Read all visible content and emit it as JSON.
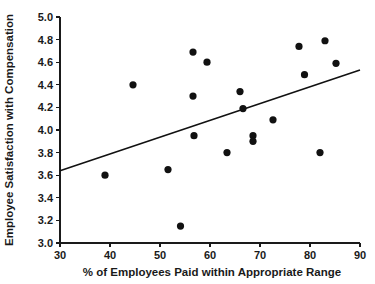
{
  "chart_data": {
    "type": "scatter",
    "title": "",
    "xlabel": "% of Employees Paid within Appropriate Range",
    "ylabel": "Employee Satisfaction with Compensation",
    "xlim": [
      30,
      90
    ],
    "ylim": [
      3.0,
      5.0
    ],
    "xticks": [
      30,
      40,
      50,
      60,
      70,
      80,
      90
    ],
    "xtick_labels": [
      "30",
      "40",
      "50",
      "60",
      "70",
      "80",
      "90"
    ],
    "yticks": [
      3.0,
      3.2,
      3.4,
      3.6,
      3.8,
      4.0,
      4.2,
      4.4,
      4.6,
      4.8,
      5.0
    ],
    "ytick_labels": [
      "3.0",
      "3.2",
      "3.4",
      "3.6",
      "3.8",
      "4.0",
      "4.2",
      "4.4",
      "4.6",
      "4.8",
      "5.0"
    ],
    "grid": false,
    "legend": false,
    "legend_position": "none",
    "marker": "filled-circle",
    "marker_color": "#111111",
    "points": [
      {
        "x": 39.0,
        "y": 3.6
      },
      {
        "x": 44.6,
        "y": 4.4
      },
      {
        "x": 51.6,
        "y": 3.65
      },
      {
        "x": 54.1,
        "y": 3.15
      },
      {
        "x": 56.6,
        "y": 4.69
      },
      {
        "x": 56.6,
        "y": 4.3
      },
      {
        "x": 56.8,
        "y": 3.95
      },
      {
        "x": 59.4,
        "y": 4.6
      },
      {
        "x": 63.4,
        "y": 3.8
      },
      {
        "x": 66.0,
        "y": 4.34
      },
      {
        "x": 66.6,
        "y": 4.19
      },
      {
        "x": 68.6,
        "y": 3.95
      },
      {
        "x": 68.6,
        "y": 3.9
      },
      {
        "x": 72.6,
        "y": 4.09
      },
      {
        "x": 77.8,
        "y": 4.74
      },
      {
        "x": 78.9,
        "y": 4.49
      },
      {
        "x": 82.0,
        "y": 3.8
      },
      {
        "x": 83.0,
        "y": 4.79
      },
      {
        "x": 85.2,
        "y": 4.59
      }
    ],
    "trend_line": {
      "type": "linear-fit",
      "x_start": 30,
      "y_start": 3.64,
      "x_end": 90,
      "y_end": 4.53
    }
  },
  "figure": {
    "background_color": "#ffffff",
    "foreground_color": "#111111"
  }
}
